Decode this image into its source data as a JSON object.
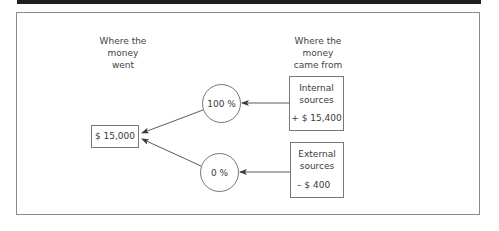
{
  "diagram": {
    "left_heading": [
      "Where the",
      "money",
      "went"
    ],
    "right_heading": [
      "Where the",
      "money",
      "came from"
    ],
    "total": "$ 15,000",
    "internal": {
      "title": [
        "Internal",
        "sources"
      ],
      "amount": "+ $ 15,400",
      "share": "100 %"
    },
    "external": {
      "title": [
        "External",
        "sources"
      ],
      "amount": "– $ 400",
      "share": "0 %"
    },
    "colors": {
      "line": "#5a5a5a",
      "frame": "#8a8a8a",
      "bar": "#1f1f1f"
    }
  }
}
